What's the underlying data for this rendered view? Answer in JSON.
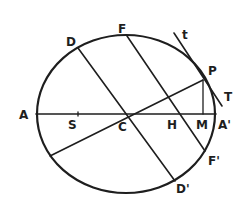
{
  "figure": {
    "ink_color": "#1e1e1e",
    "background": "#ffffff"
  },
  "labels": {
    "A": "A",
    "S": "S",
    "C": "C",
    "H": "H",
    "M": "M",
    "A_prime": "A'",
    "D": "D",
    "F": "F",
    "P": "P",
    "t": "t",
    "T": "T",
    "F_prime": "F'",
    "D_prime": "D'"
  }
}
